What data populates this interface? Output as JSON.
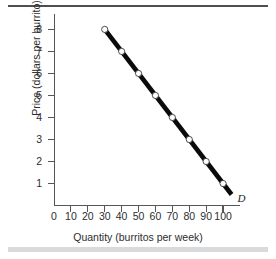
{
  "figure": {
    "background_color": "#ffffff",
    "top_rule_color": "#4f4f4f",
    "bottom_band_color": "#d9dadc",
    "axis_color": "#55565a",
    "curve_color": "#0a0a0a",
    "marker_fill": "#ffffff"
  },
  "chart_data": {
    "type": "line",
    "title": "",
    "xlabel": "Quantity (burritos per week)",
    "ylabel": "Price (dollars per burrito)",
    "xlim": [
      0,
      110
    ],
    "ylim": [
      0,
      8.7
    ],
    "grid": false,
    "legend": "none",
    "xticks": [
      0,
      10,
      20,
      30,
      40,
      50,
      60,
      70,
      80,
      90,
      100
    ],
    "xticklabels": [
      "0",
      "10",
      "20",
      "30",
      "40",
      "50",
      "60",
      "70",
      "80",
      "90",
      "100"
    ],
    "yticks": [
      1,
      2,
      3,
      4,
      5,
      6,
      7,
      8
    ],
    "yticklabels": [
      "1",
      "2",
      "3",
      "4",
      "5",
      "6",
      "7",
      "8"
    ],
    "series": [
      {
        "name": "D",
        "annotation": "D",
        "marker": "open-circle",
        "x": [
          30,
          40,
          50,
          60,
          70,
          80,
          90,
          100
        ],
        "y": [
          8,
          7,
          6,
          5,
          4,
          3,
          2,
          1
        ],
        "line_extends_to": {
          "x": 105,
          "y": 0.5
        }
      }
    ]
  }
}
